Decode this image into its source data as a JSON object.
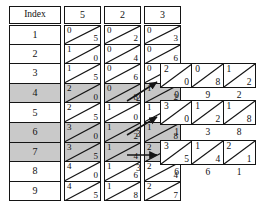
{
  "figure": {
    "type": "lattice-multiplication-table",
    "index_header": "Index",
    "multiplier_headers": [
      "5",
      "2",
      "3"
    ],
    "index_values": [
      "1",
      "2",
      "3",
      "4",
      "5",
      "6",
      "7",
      "8",
      "9"
    ],
    "highlighted_rows": [
      4,
      6,
      7
    ],
    "columns": [
      {
        "header": "5",
        "cells": [
          {
            "hi": "0",
            "lo": "5"
          },
          {
            "hi": "1",
            "lo": "0"
          },
          {
            "hi": "1",
            "lo": "5"
          },
          {
            "hi": "2",
            "lo": "0"
          },
          {
            "hi": "2",
            "lo": "5"
          },
          {
            "hi": "3",
            "lo": "0"
          },
          {
            "hi": "3",
            "lo": "5"
          },
          {
            "hi": "4",
            "lo": "0"
          },
          {
            "hi": "4",
            "lo": "5"
          }
        ]
      },
      {
        "header": "2",
        "cells": [
          {
            "hi": "0",
            "lo": "2"
          },
          {
            "hi": "0",
            "lo": "4"
          },
          {
            "hi": "0",
            "lo": "6"
          },
          {
            "hi": "0",
            "lo": "8"
          },
          {
            "hi": "1",
            "lo": "0"
          },
          {
            "hi": "1",
            "lo": "2"
          },
          {
            "hi": "1",
            "lo": "4"
          },
          {
            "hi": "1",
            "lo": "6"
          },
          {
            "hi": "1",
            "lo": "8"
          }
        ]
      },
      {
        "header": "3",
        "cells": [
          {
            "hi": "0",
            "lo": "3"
          },
          {
            "hi": "0",
            "lo": "6"
          },
          {
            "hi": "0",
            "lo": "9"
          },
          {
            "hi": "1",
            "lo": "2"
          },
          {
            "hi": "1",
            "lo": "5"
          },
          {
            "hi": "1",
            "lo": "8"
          },
          {
            "hi": "2",
            "lo": "1"
          },
          {
            "hi": "2",
            "lo": "4"
          },
          {
            "hi": "2",
            "lo": "7"
          }
        ]
      }
    ],
    "arrow_labels": [
      "2",
      "3",
      "3"
    ],
    "result_rows": [
      {
        "cells": [
          {
            "hi": "2",
            "lo": "0"
          },
          {
            "hi": "0",
            "lo": "8"
          },
          {
            "hi": "1",
            "lo": "2"
          }
        ],
        "sums": [
          "0",
          "9",
          "2"
        ]
      },
      {
        "cells": [
          {
            "hi": "3",
            "lo": "0"
          },
          {
            "hi": "1",
            "lo": "2"
          },
          {
            "hi": "1",
            "lo": "8"
          }
        ],
        "sums": [
          "1",
          "3",
          "8"
        ]
      },
      {
        "cells": [
          {
            "hi": "3",
            "lo": "5"
          },
          {
            "hi": "1",
            "lo": "4"
          },
          {
            "hi": "2",
            "lo": "1"
          }
        ],
        "sums": [
          "6",
          "6",
          "1"
        ]
      }
    ]
  }
}
